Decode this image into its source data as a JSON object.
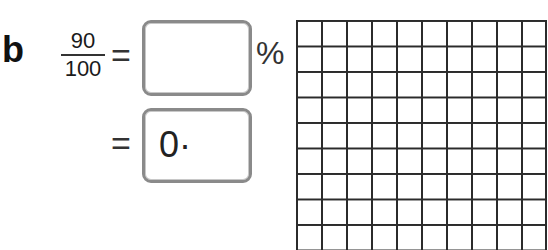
{
  "exercise": {
    "label": "b",
    "fraction": {
      "numerator": "90",
      "denominator": "100"
    },
    "equals_sign": "=",
    "percent_answer": {
      "value": "",
      "suffix": "%"
    },
    "decimal_answer": {
      "prefill": "0·",
      "value": ""
    }
  },
  "grid": {
    "columns": 10,
    "rows": 10,
    "visible_rows": 9,
    "line_color": "#2b2b2b"
  }
}
